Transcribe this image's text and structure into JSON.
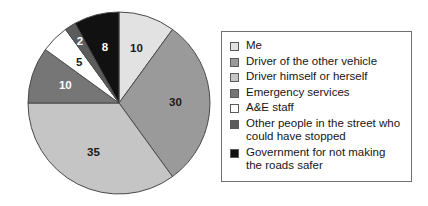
{
  "chart_data": {
    "type": "pie",
    "title": "",
    "subtitle": "",
    "xlabel": "",
    "ylabel": "",
    "legend_position": "right",
    "grid": false,
    "start_angle_deg": 0,
    "direction": "clockwise",
    "total": 100,
    "units": "percent",
    "categories": [
      "Me",
      "Driver of the other vehicle",
      "Driver himself or herself",
      "Emergency services",
      "A&E staff",
      "Other people in the street who could have stopped",
      "Government for not making the roads safer"
    ],
    "values": [
      10,
      30,
      35,
      10,
      5,
      2,
      8
    ],
    "labels": [
      "10",
      "30",
      "35",
      "10",
      "5",
      "2",
      "8"
    ],
    "colors": [
      "#e2e2e2",
      "#9a9a9a",
      "#c5c5c5",
      "#767676",
      "#ffffff",
      "#5c5c5c",
      "#111111"
    ],
    "label_colors": [
      "#1a1a1a",
      "#1a1a1a",
      "#1a1a1a",
      "#ffffff",
      "#1a1a1a",
      "#ffffff",
      "#ffffff"
    ],
    "slice_border_color": "#4a4a4a"
  },
  "legend": {
    "items": [
      {
        "label": "Me",
        "color": "#e2e2e2"
      },
      {
        "label": "Driver of the other vehicle",
        "color": "#9a9a9a"
      },
      {
        "label": "Driver himself or herself",
        "color": "#c5c5c5"
      },
      {
        "label": "Emergency services",
        "color": "#767676"
      },
      {
        "label": "A&E staff",
        "color": "#ffffff"
      },
      {
        "label": "Other people in the street who\ncould have stopped",
        "color": "#5c5c5c"
      },
      {
        "label": "Government for not making\nthe roads safer",
        "color": "#111111"
      }
    ]
  }
}
